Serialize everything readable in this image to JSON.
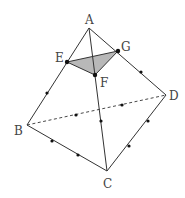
{
  "diagram": {
    "type": "tetrahedron with cross-section",
    "colors": {
      "line": "#333333",
      "fill": "#b8b8b8",
      "dot": "#111111",
      "label": "#444444"
    },
    "points": {
      "A": {
        "label": "A",
        "x": 89,
        "y": 28,
        "lx": 85,
        "ly": 24
      },
      "B": {
        "label": "B",
        "x": 27,
        "y": 125,
        "lx": 14,
        "ly": 135
      },
      "C": {
        "label": "C",
        "x": 107,
        "y": 171,
        "lx": 103,
        "ly": 188
      },
      "D": {
        "label": "D",
        "x": 166,
        "y": 95,
        "lx": 169,
        "ly": 100
      },
      "E": {
        "label": "E",
        "x": 67,
        "y": 62,
        "lx": 55,
        "ly": 62
      },
      "F": {
        "label": "F",
        "x": 95,
        "y": 75,
        "lx": 100,
        "ly": 87
      },
      "G": {
        "label": "G",
        "x": 118,
        "y": 51,
        "lx": 121,
        "ly": 51
      }
    },
    "solid_edges": [
      [
        "A",
        "B"
      ],
      [
        "A",
        "C"
      ],
      [
        "A",
        "D"
      ],
      [
        "B",
        "C"
      ],
      [
        "C",
        "D"
      ]
    ],
    "dashed_edges": [
      [
        "B",
        "D"
      ]
    ],
    "shaded_triangle": [
      "E",
      "F",
      "G"
    ],
    "tick_dots": [
      {
        "x": 47,
        "y": 93
      },
      {
        "x": 141,
        "y": 72
      },
      {
        "x": 52,
        "y": 141
      },
      {
        "x": 78,
        "y": 155
      },
      {
        "x": 129,
        "y": 146
      },
      {
        "x": 148,
        "y": 121
      },
      {
        "x": 76,
        "y": 115
      },
      {
        "x": 122,
        "y": 105
      },
      {
        "x": 101,
        "y": 121
      }
    ]
  }
}
